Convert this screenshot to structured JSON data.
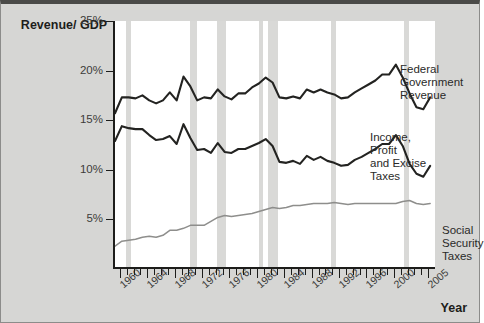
{
  "chart_data": {
    "type": "line",
    "title": "",
    "ylabel": "Revenue/\nGDP",
    "xlabel": "Year",
    "ylim": [
      0,
      25
    ],
    "xlim": [
      1959,
      2006
    ],
    "grid": false,
    "legend_position": "inline-annotations",
    "y_ticks": [
      "25%",
      "20%",
      "15%",
      "10%",
      "5%"
    ],
    "y_tick_values": [
      25,
      20,
      15,
      10,
      5
    ],
    "x_ticks": [
      "1960",
      "1964",
      "1968",
      "1972",
      "1976",
      "1980",
      "1984",
      "1988",
      "1992",
      "1996",
      "2000",
      "2005"
    ],
    "x_tick_values": [
      1960,
      1964,
      1968,
      1972,
      1976,
      1980,
      1984,
      1988,
      1992,
      1996,
      2000,
      2005
    ],
    "x": [
      1959,
      1960,
      1961,
      1962,
      1963,
      1964,
      1965,
      1966,
      1967,
      1968,
      1969,
      1970,
      1971,
      1972,
      1973,
      1974,
      1975,
      1976,
      1977,
      1978,
      1979,
      1980,
      1981,
      1982,
      1983,
      1984,
      1985,
      1986,
      1987,
      1988,
      1989,
      1990,
      1991,
      1992,
      1993,
      1994,
      1995,
      1996,
      1997,
      1998,
      1999,
      2000,
      2001,
      2002,
      2003,
      2004,
      2005
    ],
    "series": [
      {
        "name": "Federal Government Revenue",
        "color": "#232321",
        "annotation": "Federal\nGovernment Revenue",
        "values": [
          15.7,
          17.3,
          17.3,
          17.2,
          17.5,
          17.0,
          16.7,
          17.0,
          17.8,
          17.0,
          19.4,
          18.4,
          17.0,
          17.3,
          17.2,
          18.1,
          17.4,
          17.1,
          17.7,
          17.7,
          18.3,
          18.7,
          19.3,
          18.8,
          17.3,
          17.2,
          17.4,
          17.2,
          18.1,
          17.8,
          18.1,
          17.8,
          17.6,
          17.2,
          17.3,
          17.8,
          18.2,
          18.6,
          19.0,
          19.6,
          19.6,
          20.6,
          19.3,
          17.7,
          16.3,
          16.1,
          17.3
        ]
      },
      {
        "name": "Income, Profit and Excise Taxes",
        "color": "#232321",
        "annotation": "Income, Profit\nand Excise Taxes",
        "values": [
          12.9,
          14.4,
          14.2,
          14.1,
          14.1,
          13.5,
          13.0,
          13.1,
          13.4,
          12.6,
          14.6,
          13.2,
          12.0,
          12.1,
          11.7,
          12.7,
          11.8,
          11.7,
          12.1,
          12.1,
          12.4,
          12.7,
          13.1,
          12.4,
          10.8,
          10.7,
          10.9,
          10.6,
          11.4,
          11.0,
          11.3,
          10.9,
          10.7,
          10.4,
          10.5,
          11.0,
          11.3,
          11.7,
          12.1,
          12.6,
          12.6,
          13.5,
          12.4,
          10.6,
          9.6,
          9.3,
          10.4
        ]
      },
      {
        "name": "Social Security Taxes",
        "color": "#8e8e8c",
        "annotation": "Social Security\nTaxes",
        "values": [
          2.3,
          2.8,
          2.9,
          3.0,
          3.2,
          3.3,
          3.2,
          3.4,
          3.9,
          3.9,
          4.1,
          4.4,
          4.4,
          4.4,
          4.8,
          5.2,
          5.4,
          5.3,
          5.4,
          5.5,
          5.6,
          5.8,
          6.0,
          6.2,
          6.1,
          6.2,
          6.4,
          6.4,
          6.5,
          6.6,
          6.6,
          6.6,
          6.7,
          6.6,
          6.5,
          6.6,
          6.6,
          6.6,
          6.6,
          6.6,
          6.6,
          6.6,
          6.8,
          6.9,
          6.6,
          6.5,
          6.6
        ]
      }
    ],
    "recession_bands": [
      {
        "start": 1960.6,
        "end": 1961.4
      },
      {
        "start": 1969.9,
        "end": 1970.9
      },
      {
        "start": 1973.9,
        "end": 1975.2
      },
      {
        "start": 1980.0,
        "end": 1980.6
      },
      {
        "start": 1981.4,
        "end": 1982.8
      },
      {
        "start": 1990.5,
        "end": 1991.2
      },
      {
        "start": 2001.2,
        "end": 2001.9
      }
    ],
    "colors": {
      "background": "#d6d6d4",
      "plot_background": "#ffffff",
      "axis": "#1d1d1b",
      "band": "#d9d9d7",
      "dark_series": "#232321",
      "light_series": "#8e8e8c"
    }
  }
}
